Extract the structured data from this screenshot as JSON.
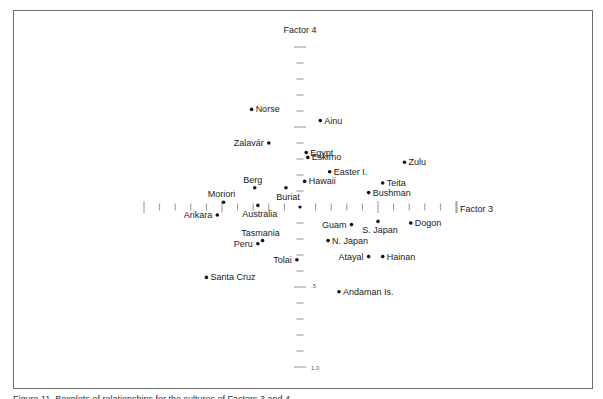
{
  "chart_data": {
    "type": "scatter",
    "title": "",
    "xlabel": "Factor 3",
    "ylabel": "Factor 4",
    "xlim": [
      -1.0,
      1.0
    ],
    "ylim": [
      -1.0,
      1.0
    ],
    "y_axis_direction": "positive downward",
    "y_tick_labels": [
      ".5",
      "1.0"
    ],
    "x_tick_interval": 0.1,
    "y_tick_interval": 0.1,
    "grid": false,
    "legend": null,
    "points": [
      {
        "label": "Norse",
        "x": -0.31,
        "y": -0.61,
        "label_side": "right"
      },
      {
        "label": "Ainu",
        "x": 0.13,
        "y": -0.54,
        "label_side": "right"
      },
      {
        "label": "Zalavár",
        "x": -0.2,
        "y": -0.4,
        "label_side": "left"
      },
      {
        "label": "Egypt",
        "x": 0.04,
        "y": -0.34,
        "label_side": "right"
      },
      {
        "label": "Eskimo",
        "x": 0.05,
        "y": -0.31,
        "label_side": "right"
      },
      {
        "label": "Zulu",
        "x": 0.67,
        "y": -0.28,
        "label_side": "right"
      },
      {
        "label": "Easter I.",
        "x": 0.19,
        "y": -0.22,
        "label_side": "right"
      },
      {
        "label": "Hawaii",
        "x": 0.03,
        "y": -0.16,
        "label_side": "right"
      },
      {
        "label": "Teita",
        "x": 0.53,
        "y": -0.15,
        "label_side": "right"
      },
      {
        "label": "Berg",
        "x": -0.29,
        "y": -0.12,
        "label_side": "above"
      },
      {
        "label": "Buriat",
        "x": -0.09,
        "y": -0.12,
        "label_side": "below"
      },
      {
        "label": "Bushman",
        "x": 0.44,
        "y": -0.09,
        "label_side": "right"
      },
      {
        "label": "Moriori",
        "x": -0.49,
        "y": -0.03,
        "label_side": "above"
      },
      {
        "label": "Australia",
        "x": -0.27,
        "y": -0.01,
        "label_side": "below"
      },
      {
        "label": "Arikara",
        "x": -0.53,
        "y": 0.05,
        "label_side": "left"
      },
      {
        "label": "Guam",
        "x": 0.33,
        "y": 0.11,
        "label_side": "left"
      },
      {
        "label": "S. Japan",
        "x": 0.5,
        "y": 0.09,
        "label_side": "below"
      },
      {
        "label": "Dogon",
        "x": 0.71,
        "y": 0.1,
        "label_side": "right"
      },
      {
        "label": "Tasmania",
        "x": -0.24,
        "y": 0.21,
        "label_side": "above"
      },
      {
        "label": "N. Japan",
        "x": 0.18,
        "y": 0.21,
        "label_side": "right"
      },
      {
        "label": "Peru",
        "x": -0.27,
        "y": 0.23,
        "label_side": "left"
      },
      {
        "label": "Atayal",
        "x": 0.44,
        "y": 0.31,
        "label_side": "left"
      },
      {
        "label": "Hainan",
        "x": 0.53,
        "y": 0.31,
        "label_side": "right"
      },
      {
        "label": "Tolai",
        "x": -0.02,
        "y": 0.33,
        "label_side": "left"
      },
      {
        "label": "Santa Cruz",
        "x": -0.6,
        "y": 0.44,
        "label_side": "right"
      },
      {
        "label": "Andaman Is.",
        "x": 0.25,
        "y": 0.53,
        "label_side": "right"
      }
    ]
  },
  "axes": {
    "x_title": "Factor 3",
    "y_title": "Factor 4",
    "y_tick_half": ".5",
    "y_tick_one": "1.0"
  },
  "caption": "Figure 11.  Boxplots of relationships for the cultures of Factors 3 and 4"
}
